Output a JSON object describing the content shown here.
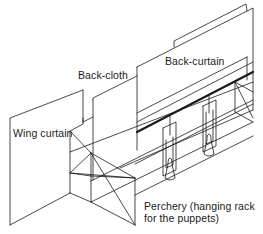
{
  "diagram": {
    "labels": {
      "back_curtain": "Back-curtain",
      "back_cloth": "Back-cloth",
      "wing_curtain": "Wing curtain",
      "perchery_line1": "Perchery (hanging rack",
      "perchery_line2": "for the puppets)"
    },
    "colors": {
      "line": "#1a1a1a",
      "background": "#ffffff"
    }
  }
}
